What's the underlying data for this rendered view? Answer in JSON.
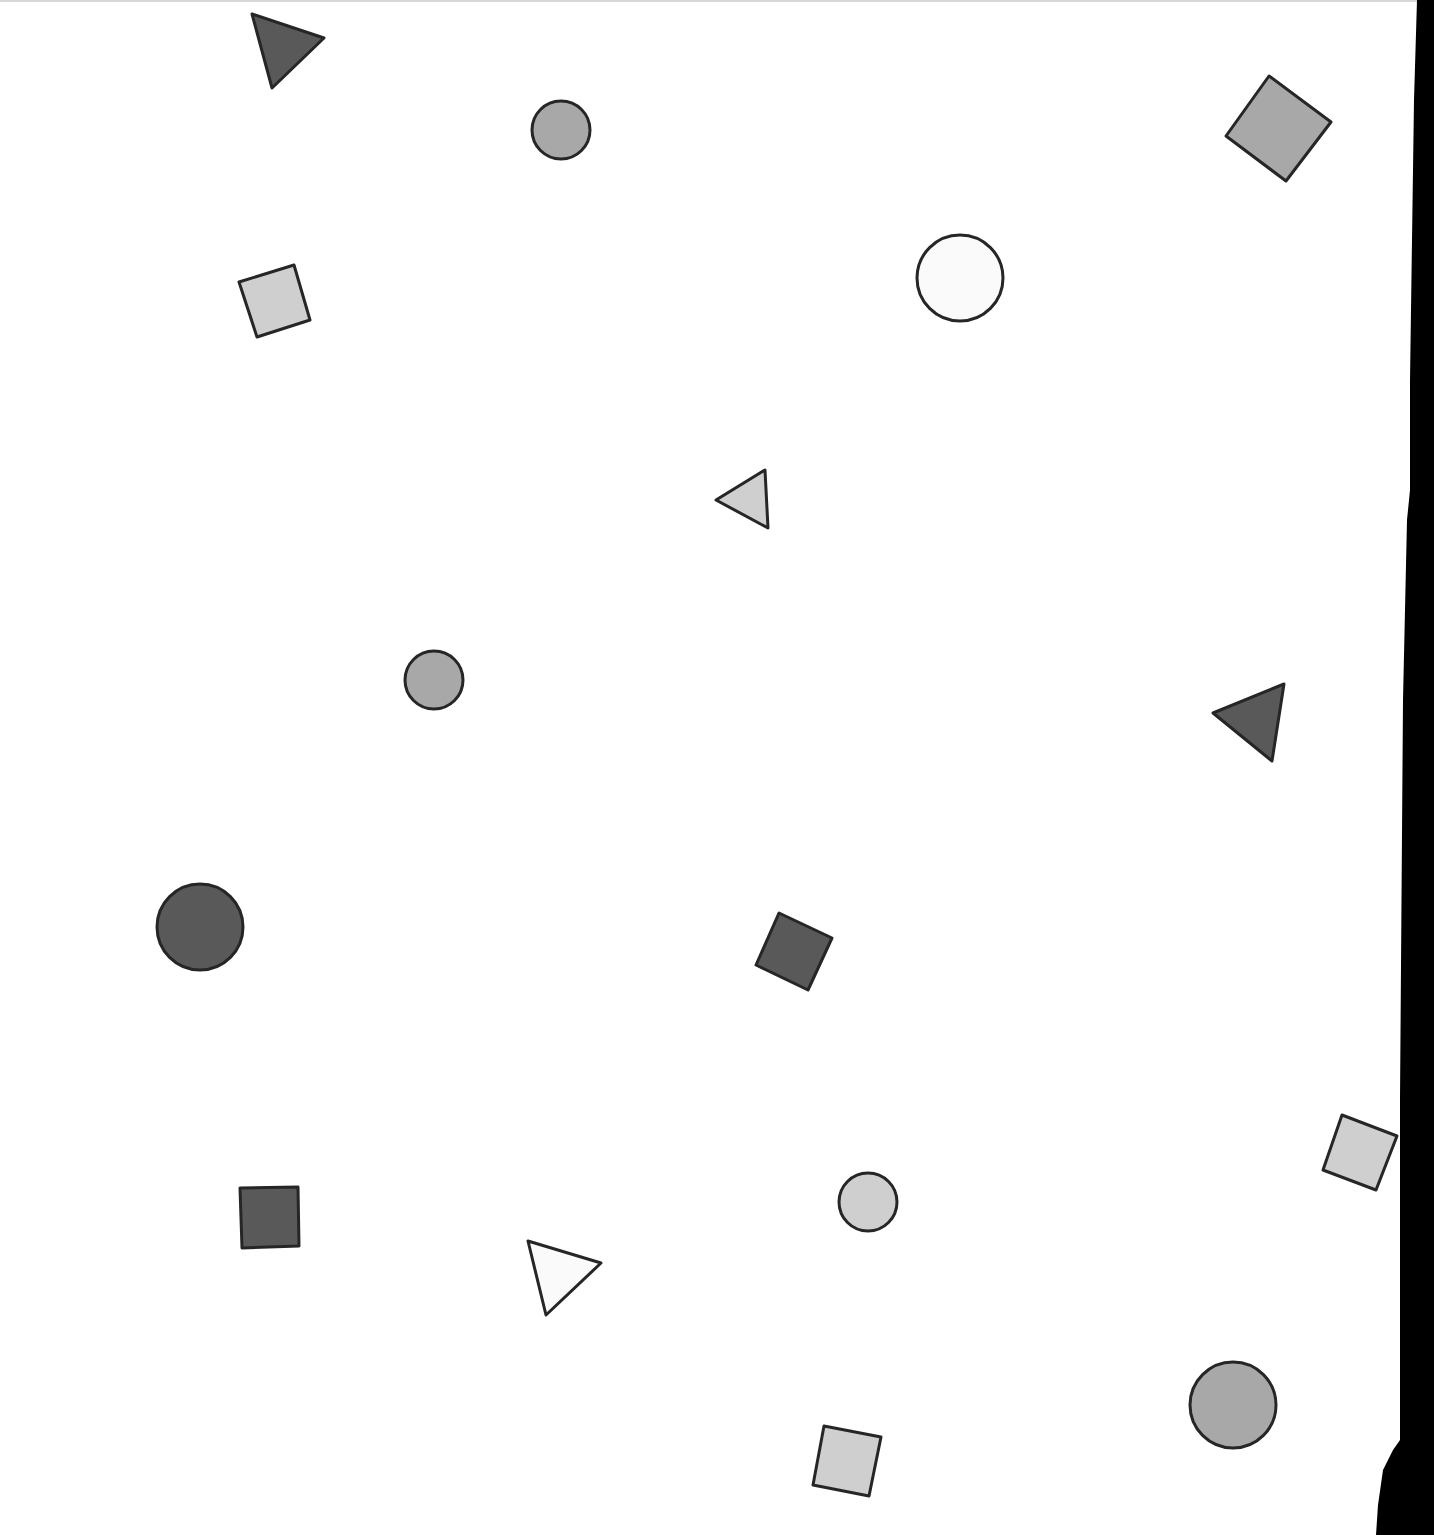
{
  "page": {
    "background": "#ffffff",
    "edge_color": "#000000"
  },
  "colors": {
    "dark": "#595959",
    "medium": "#a8a8a8",
    "light": "#cfcfcf",
    "white": "#fafafa",
    "stroke": "#262626"
  },
  "shapes": [
    {
      "type": "triangle",
      "fill": "dark",
      "points": [
        [
          252,
          14
        ],
        [
          324,
          38
        ],
        [
          272,
          88
        ]
      ]
    },
    {
      "type": "circle",
      "fill": "medium",
      "cx": 561,
      "cy": 130,
      "r": 29
    },
    {
      "type": "square",
      "fill": "medium",
      "points": [
        [
          1269,
          76
        ],
        [
          1331,
          122
        ],
        [
          1286,
          181
        ],
        [
          1226,
          136
        ]
      ]
    },
    {
      "type": "square",
      "fill": "light",
      "points": [
        [
          239,
          282
        ],
        [
          294,
          265
        ],
        [
          310,
          320
        ],
        [
          257,
          337
        ]
      ]
    },
    {
      "type": "circle",
      "fill": "white",
      "cx": 960,
      "cy": 278,
      "r": 43
    },
    {
      "type": "triangle",
      "fill": "light",
      "points": [
        [
          716,
          500
        ],
        [
          765,
          470
        ],
        [
          768,
          528
        ]
      ]
    },
    {
      "type": "circle",
      "fill": "medium",
      "cx": 434,
      "cy": 680,
      "r": 29
    },
    {
      "type": "triangle",
      "fill": "dark",
      "points": [
        [
          1213,
          713
        ],
        [
          1284,
          684
        ],
        [
          1272,
          761
        ]
      ]
    },
    {
      "type": "circle",
      "fill": "dark",
      "cx": 200,
      "cy": 927,
      "r": 43
    },
    {
      "type": "square",
      "fill": "dark",
      "points": [
        [
          779,
          913
        ],
        [
          832,
          938
        ],
        [
          808,
          990
        ],
        [
          756,
          965
        ]
      ]
    },
    {
      "type": "square",
      "fill": "light",
      "points": [
        [
          1342,
          1115
        ],
        [
          1397,
          1136
        ],
        [
          1376,
          1190
        ],
        [
          1323,
          1170
        ]
      ]
    },
    {
      "type": "circle",
      "fill": "light",
      "cx": 868,
      "cy": 1202,
      "r": 29
    },
    {
      "type": "square",
      "fill": "dark",
      "points": [
        [
          240,
          1188
        ],
        [
          298,
          1187
        ],
        [
          299,
          1246
        ],
        [
          242,
          1248
        ]
      ]
    },
    {
      "type": "triangle",
      "fill": "white",
      "points": [
        [
          528,
          1241
        ],
        [
          601,
          1263
        ],
        [
          546,
          1315
        ]
      ]
    },
    {
      "type": "circle",
      "fill": "medium",
      "cx": 1233,
      "cy": 1405,
      "r": 43
    },
    {
      "type": "square",
      "fill": "light",
      "points": [
        [
          824,
          1426
        ],
        [
          881,
          1437
        ],
        [
          869,
          1496
        ],
        [
          813,
          1485
        ]
      ]
    }
  ],
  "edge": {
    "points": [
      [
        1417,
        0
      ],
      [
        1434,
        0
      ],
      [
        1434,
        1535
      ],
      [
        1376,
        1535
      ],
      [
        1378,
        1505
      ],
      [
        1383,
        1470
      ],
      [
        1393,
        1450
      ],
      [
        1400,
        1440
      ],
      [
        1400,
        1100
      ],
      [
        1403,
        700
      ],
      [
        1407,
        520
      ],
      [
        1410,
        490
      ],
      [
        1410,
        380
      ],
      [
        1414,
        100
      ],
      [
        1417,
        0
      ]
    ]
  }
}
